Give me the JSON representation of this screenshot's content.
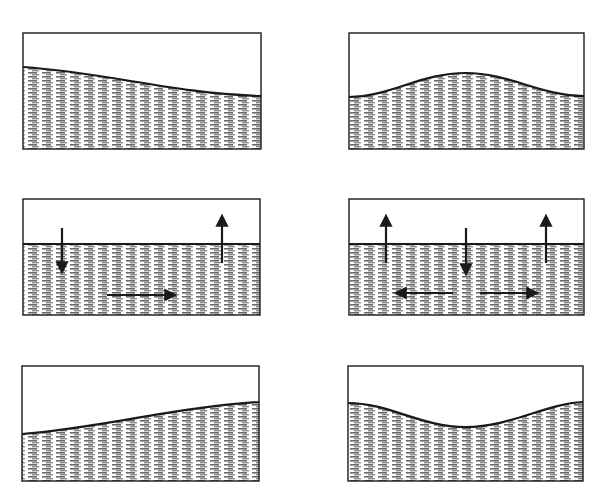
{
  "diagram": {
    "colors": {
      "ink": "#1a1a1a",
      "water_fill": "#9a9a9a",
      "background": "#ffffff"
    },
    "panels": [
      {
        "id": "left-top",
        "column": "left",
        "row": 1,
        "box": [
          23,
          33,
          261,
          149
        ],
        "surface": "M23,67 C110,73 170,93 261,96",
        "arrows": []
      },
      {
        "id": "right-top",
        "column": "right",
        "row": 1,
        "box": [
          349,
          33,
          584,
          149
        ],
        "surface": "M349,97 C390,97 420,73 466,73 C510,73 540,96 584,96",
        "arrows": []
      },
      {
        "id": "left-middle",
        "column": "left",
        "row": 2,
        "box": [
          23,
          199,
          260,
          315
        ],
        "surface": "M23,244 L260,244",
        "arrows": [
          {
            "name": "down-arrow",
            "from": [
              62,
              228
            ],
            "to": [
              62,
              270
            ]
          },
          {
            "name": "up-arrow",
            "from": [
              222,
              263
            ],
            "to": [
              222,
              218
            ]
          },
          {
            "name": "right-arrow",
            "from": [
              107,
              295
            ],
            "to": [
              173,
              295
            ]
          }
        ]
      },
      {
        "id": "right-middle",
        "column": "right",
        "row": 2,
        "box": [
          349,
          199,
          584,
          315
        ],
        "surface": "M349,244 L584,244",
        "arrows": [
          {
            "name": "up-arrow",
            "from": [
              386,
              263
            ],
            "to": [
              386,
              218
            ]
          },
          {
            "name": "down-arrow",
            "from": [
              466,
              228
            ],
            "to": [
              466,
              272
            ]
          },
          {
            "name": "up-arrow",
            "from": [
              546,
              263
            ],
            "to": [
              546,
              218
            ]
          },
          {
            "name": "left-arrow",
            "from": [
              453,
              293
            ],
            "to": [
              398,
              293
            ]
          },
          {
            "name": "right-arrow",
            "from": [
              480,
              293
            ],
            "to": [
              535,
              293
            ]
          }
        ]
      },
      {
        "id": "left-bottom",
        "column": "left",
        "row": 3,
        "box": [
          22,
          366,
          259,
          481
        ],
        "surface": "M22,434 C100,428 170,408 259,402",
        "arrows": []
      },
      {
        "id": "right-bottom",
        "column": "right",
        "row": 3,
        "box": [
          348,
          366,
          583,
          481
        ],
        "surface": "M348,403 C390,403 420,427 466,427 C510,427 545,404 583,402",
        "arrows": []
      }
    ]
  }
}
